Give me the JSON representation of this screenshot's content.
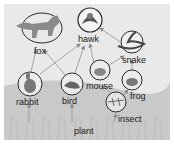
{
  "diagram": {
    "type": "food-web",
    "nodes": [
      {
        "id": "fox",
        "label": "fox"
      },
      {
        "id": "hawk",
        "label": "hawk"
      },
      {
        "id": "snake",
        "label": "snake"
      },
      {
        "id": "rabbit",
        "label": "rabbit"
      },
      {
        "id": "bird",
        "label": "bird"
      },
      {
        "id": "mouse",
        "label": "mouse"
      },
      {
        "id": "frog",
        "label": "frog"
      },
      {
        "id": "insect",
        "label": "insect"
      },
      {
        "id": "plant",
        "label": "plant"
      }
    ],
    "edges": [
      {
        "from": "plant",
        "to": "rabbit"
      },
      {
        "from": "plant",
        "to": "bird"
      },
      {
        "from": "plant",
        "to": "insect"
      },
      {
        "from": "plant",
        "to": "mouse"
      },
      {
        "from": "rabbit",
        "to": "fox"
      },
      {
        "from": "rabbit",
        "to": "hawk"
      },
      {
        "from": "bird",
        "to": "fox"
      },
      {
        "from": "bird",
        "to": "hawk"
      },
      {
        "from": "mouse",
        "to": "hawk"
      },
      {
        "from": "mouse",
        "to": "snake"
      },
      {
        "from": "insect",
        "to": "frog"
      },
      {
        "from": "insect",
        "to": "mouse"
      },
      {
        "from": "frog",
        "to": "snake"
      },
      {
        "from": "snake",
        "to": "hawk"
      }
    ]
  },
  "colors": {
    "background": "#e9e9e9",
    "grass": "#c8c8c8",
    "arrow": "#9a9a9a",
    "circle": "#2a2a2a",
    "text": "#1a1a1a"
  }
}
